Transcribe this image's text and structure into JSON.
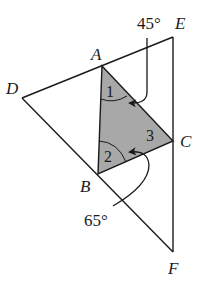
{
  "figure": {
    "type": "geometry",
    "points": {
      "A": {
        "label": "A",
        "x": 102,
        "y": 66
      },
      "B": {
        "label": "B",
        "x": 98,
        "y": 174
      },
      "C": {
        "label": "C",
        "x": 173,
        "y": 141
      },
      "D": {
        "label": "D",
        "x": 22,
        "y": 98
      },
      "E": {
        "label": "E",
        "x": 173,
        "y": 37
      },
      "F": {
        "label": "F",
        "x": 173,
        "y": 252
      }
    },
    "angles": {
      "angle1": "1",
      "angle2": "2",
      "angle3": "3",
      "top_given": "45°",
      "bottom_given": "65°"
    },
    "colors": {
      "shaded_triangle": "#a8a8a8",
      "stroke": "#1a1a1a"
    }
  }
}
